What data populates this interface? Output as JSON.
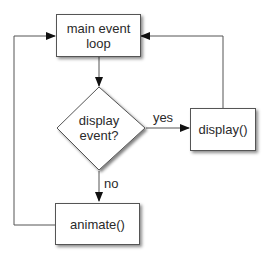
{
  "diagram": {
    "type": "flowchart",
    "nodes": {
      "main_loop": {
        "line1": "main event",
        "line2": "loop"
      },
      "decision": {
        "line1": "display",
        "line2": "event?"
      },
      "display": {
        "label": "display()"
      },
      "animate": {
        "label": "animate()"
      }
    },
    "edges": {
      "yes_label": "yes",
      "no_label": "no"
    },
    "colors": {
      "stroke": "#555555",
      "text": "#2a2a2a",
      "background": "#ffffff"
    }
  }
}
